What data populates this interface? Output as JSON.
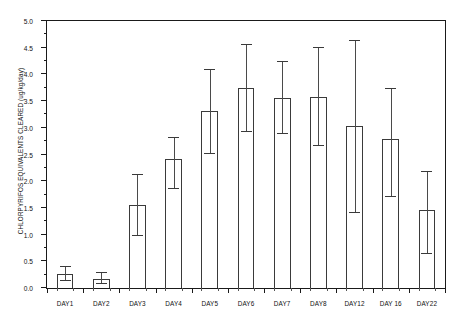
{
  "chart_data": {
    "type": "bar",
    "title": "",
    "xlabel": "",
    "ylabel": "CHLORPYRIFOS EQUIVALENTS CLEARED (ug/kg/day)",
    "ylim": [
      0.0,
      5.0
    ],
    "ytick_labels": [
      "0.0",
      "0.5",
      "1.0",
      "1.5",
      "2.0",
      "2.5",
      "3.0",
      "3.5",
      "4.0",
      "4.5",
      "5.0"
    ],
    "ytick_values": [
      0.0,
      0.5,
      1.0,
      1.5,
      2.0,
      2.5,
      3.0,
      3.5,
      4.0,
      4.5,
      5.0
    ],
    "grid": false,
    "legend": "none",
    "categories": [
      "DAY1",
      "DAY2",
      "DAY3",
      "DAY4",
      "DAY5",
      "DAY6",
      "DAY7",
      "DAY8",
      "DAY12",
      "DAY 16",
      "DAY22"
    ],
    "values": [
      0.26,
      0.17,
      1.55,
      2.41,
      3.32,
      3.74,
      3.56,
      3.58,
      3.03,
      2.79,
      1.46
    ],
    "err_upper": [
      0.4,
      0.28,
      2.12,
      2.81,
      4.09,
      4.55,
      4.24,
      4.5,
      4.63,
      3.72,
      2.17
    ],
    "err_lower": [
      0.13,
      0.07,
      0.97,
      1.86,
      2.51,
      2.92,
      2.89,
      2.66,
      1.4,
      1.71,
      0.63
    ]
  }
}
